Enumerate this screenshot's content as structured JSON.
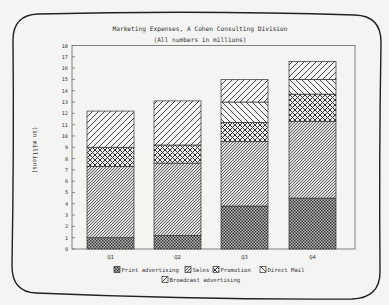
{
  "chart_data": {
    "type": "bar",
    "stacked": true,
    "title": "Marketing Expenses, A Cohen Consulting Division",
    "subtitle": "(All numbers in millions)",
    "xlabel": "",
    "ylabel": "(in millions)",
    "ylim": [
      0,
      18
    ],
    "yticks": [
      0,
      1,
      2,
      3,
      4,
      5,
      6,
      7,
      8,
      9,
      10,
      11,
      12,
      13,
      14,
      15,
      16,
      17,
      18
    ],
    "grid": false,
    "legend_position": "bottom",
    "categories": [
      "Q1",
      "Q2",
      "Q3",
      "Q4"
    ],
    "series": [
      {
        "name": "Print advertising",
        "pattern": "dots",
        "values": [
          1.0,
          1.2,
          3.8,
          4.5
        ]
      },
      {
        "name": "Sales",
        "pattern": "fine-diagonal",
        "values": [
          6.3,
          6.4,
          5.7,
          6.8
        ]
      },
      {
        "name": "Promotion",
        "pattern": "crosshatch",
        "values": [
          1.7,
          1.6,
          1.7,
          2.4
        ]
      },
      {
        "name": "Direct Mail",
        "pattern": "backslash",
        "values": [
          0,
          0,
          1.8,
          1.3
        ]
      },
      {
        "name": "Broadcast advertising",
        "pattern": "slash",
        "values": [
          3.2,
          3.9,
          2.0,
          1.6
        ]
      }
    ]
  },
  "colors": {
    "background": "#f4f4f2",
    "ink": "#333333"
  }
}
